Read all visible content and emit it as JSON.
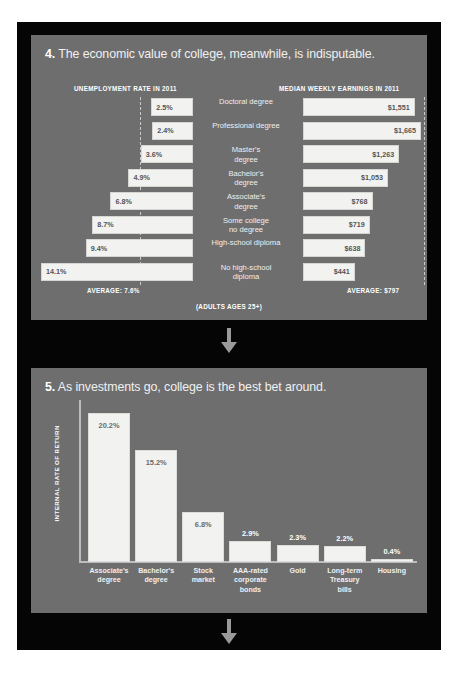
{
  "panel4": {
    "number": "4.",
    "title": "The economic value of college, meanwhile, is indisputable.",
    "left_column_header": "UNEMPLOYMENT RATE IN 2011",
    "right_column_header": "MEDIAN WEEKLY EARNINGS IN 2011",
    "left_average_label": "AVERAGE: 7.6%",
    "right_average_label": "AVERAGE: $797",
    "footnote": "(ADULTS AGES 25+)",
    "rows": [
      {
        "label": "Doctoral degree",
        "unemployment": "2.5%",
        "earnings": "$1,551"
      },
      {
        "label": "Professional degree",
        "unemployment": "2.4%",
        "earnings": "$1,665"
      },
      {
        "label": "Master's degree",
        "unemployment": "3.6%",
        "earnings": "$1,263"
      },
      {
        "label": "Bachelor's degree",
        "unemployment": "4.9%",
        "earnings": "$1,053"
      },
      {
        "label": "Associate's degree",
        "unemployment": "6.8%",
        "earnings": "$768"
      },
      {
        "label": "Some college no degree",
        "unemployment": "8.7%",
        "earnings": "$719"
      },
      {
        "label": "High-school diploma",
        "unemployment": "9.4%",
        "earnings": "$638"
      },
      {
        "label": "No high-school diploma",
        "unemployment": "14.1%",
        "earnings": "$441"
      }
    ]
  },
  "panel5": {
    "number": "5.",
    "title": "As investments go, college is the best bet around.",
    "ylabel": "INTERNAL RATE OF RETURN"
  },
  "chart_data": [
    {
      "type": "bar",
      "title": "UNEMPLOYMENT RATE IN 2011",
      "orientation": "horizontal-left",
      "categories": [
        "Doctoral degree",
        "Professional degree",
        "Master's degree",
        "Bachelor's degree",
        "Associate's degree",
        "Some college no degree",
        "High-school diploma",
        "No high-school diploma"
      ],
      "values": [
        2.5,
        2.4,
        3.6,
        4.9,
        6.8,
        8.7,
        9.4,
        14.1
      ],
      "value_labels": [
        "2.5%",
        "2.4%",
        "3.6%",
        "4.9%",
        "6.8%",
        "8.7%",
        "9.4%",
        "14.1%"
      ],
      "unit": "percent",
      "reference_line": {
        "label": "AVERAGE: 7.6%",
        "value": 7.6
      },
      "annotation": "(ADULTS AGES 25+)",
      "xlabel": "",
      "ylabel": "",
      "grid": false,
      "legend": "none"
    },
    {
      "type": "bar",
      "title": "MEDIAN WEEKLY EARNINGS IN 2011",
      "orientation": "horizontal-right",
      "categories": [
        "Doctoral degree",
        "Professional degree",
        "Master's degree",
        "Bachelor's degree",
        "Associate's degree",
        "Some college no degree",
        "High-school diploma",
        "No high-school diploma"
      ],
      "values": [
        1551,
        1665,
        1263,
        1053,
        768,
        719,
        638,
        441
      ],
      "value_labels": [
        "$1,551",
        "$1,665",
        "$1,263",
        "$1,053",
        "$768",
        "$719",
        "$638",
        "$441"
      ],
      "unit": "dollars per week",
      "reference_line": {
        "label": "AVERAGE: $797",
        "value": 797
      },
      "annotation": "(ADULTS AGES 25+)",
      "xlabel": "",
      "ylabel": "",
      "grid": false,
      "legend": "none"
    },
    {
      "type": "bar",
      "title": "As investments go, college is the best bet around.",
      "orientation": "vertical",
      "categories": [
        "Associate's degree",
        "Bachelor's degree",
        "Stock market",
        "AAA-rated corporate bonds",
        "Gold",
        "Long-term Treasury bills",
        "Housing"
      ],
      "values": [
        20.2,
        15.2,
        6.8,
        2.9,
        2.3,
        2.2,
        0.4
      ],
      "value_labels": [
        "20.2%",
        "15.2%",
        "6.8%",
        "2.9%",
        "2.3%",
        "2.2%",
        "0.4%"
      ],
      "unit": "percent",
      "xlabel": "",
      "ylabel": "INTERNAL RATE OF RETURN",
      "ylim": [
        0,
        22
      ],
      "grid": false,
      "legend": "none"
    }
  ]
}
